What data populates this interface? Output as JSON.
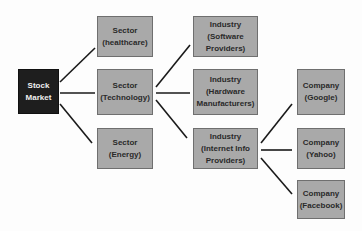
{
  "diagram": {
    "root": {
      "line1": "Stock",
      "line2": "Market"
    },
    "sectors": [
      {
        "line1": "Sector",
        "line2": "(healthcare)"
      },
      {
        "line1": "Sector",
        "line2": "(Technology)"
      },
      {
        "line1": "Sector",
        "line2": "(Energy)"
      }
    ],
    "industries": [
      {
        "line1": "Industry",
        "line2": "(Software",
        "line3": "Providers)"
      },
      {
        "line1": "Industry",
        "line2": "(Hardware",
        "line3": "Manufacturers)"
      },
      {
        "line1": "Industry",
        "line2": "(Internet Info",
        "line3": "Providers)"
      }
    ],
    "companies": [
      {
        "line1": "Company",
        "line2": "(Google)"
      },
      {
        "line1": "Company",
        "line2": "(Yahoo)"
      },
      {
        "line1": "Company",
        "line2": "(Facebook)"
      }
    ],
    "colors": {
      "root_fill": "#1e1e1e",
      "node_fill": "#a9a9a9",
      "connector": "#1a1a1a"
    }
  }
}
